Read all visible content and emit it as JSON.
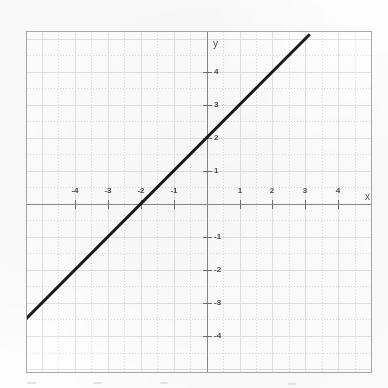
{
  "figure": {
    "kind": "cartesian-graph",
    "background_color": "#ffffff",
    "frame_color": "#a9a9a9",
    "axis_color": "#8a8a8a",
    "grid_color": "#e3e3e3",
    "line_color": "#1a1a1a",
    "axis_label_x": "x",
    "axis_label_y": "y"
  },
  "chart_data": {
    "type": "line",
    "title": "",
    "subtitle": "",
    "xlabel": "x",
    "ylabel": "y",
    "xlim": [
      -5.45,
      5.05
    ],
    "ylim": [
      -5.15,
      5.2
    ],
    "grid": true,
    "legend": null,
    "x_ticks": [
      -4,
      -3,
      -2,
      -1,
      1,
      2,
      3,
      4
    ],
    "y_ticks": [
      -4,
      -3,
      -2,
      -1,
      1,
      2,
      3,
      4
    ],
    "x_tick_labels": [
      "-4",
      "-3",
      "-2",
      "-1",
      "1",
      "2",
      "3",
      "4"
    ],
    "y_tick_labels": [
      "-4",
      "-3",
      "-2",
      "-1",
      "1",
      "2",
      "3",
      "4"
    ],
    "series": [
      {
        "name": "y = x + 2",
        "equation": "y = x + 2",
        "slope": 1,
        "y_intercept": 2,
        "x_intercept": -2,
        "x": [
          -5.45,
          3.1
        ],
        "values": [
          -3.45,
          5.1
        ],
        "points": [
          [
            -2,
            0
          ],
          [
            0,
            2
          ]
        ],
        "color": "#1a1a1a",
        "width": 3
      }
    ]
  },
  "annotations": []
}
